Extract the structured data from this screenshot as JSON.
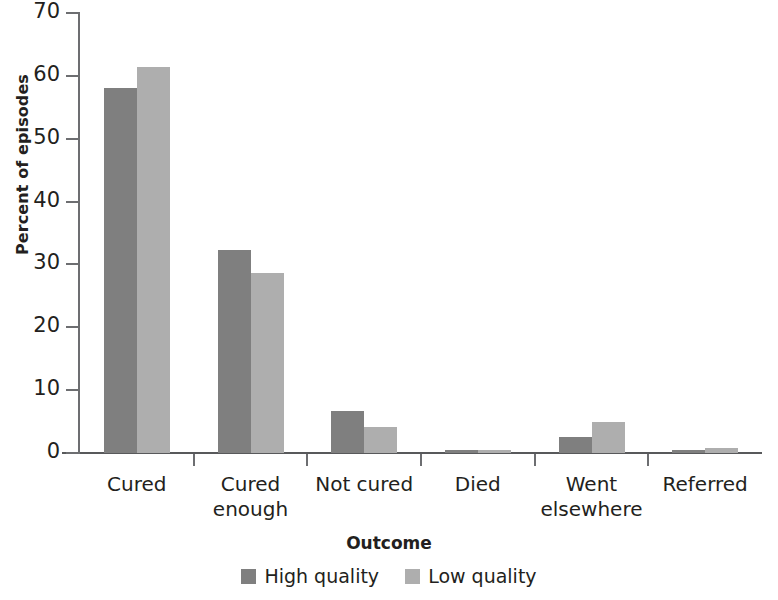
{
  "chart_data": {
    "type": "bar",
    "title": "",
    "xlabel": "Outcome",
    "ylabel": "Percent of episodes",
    "categories": [
      "Cured",
      "Cured enough",
      "Not cured",
      "Died",
      "Went elsewhere",
      "Referred"
    ],
    "category_lines": [
      [
        "Cured"
      ],
      [
        "Cured",
        "enough"
      ],
      [
        "Not cured"
      ],
      [
        "Died"
      ],
      [
        "Went",
        "elsewhere"
      ],
      [
        "Referred"
      ]
    ],
    "series": [
      {
        "name": "High quality",
        "color": "#7f7f7f",
        "values": [
          58.0,
          32.3,
          6.7,
          0.5,
          2.5,
          0.5
        ]
      },
      {
        "name": "Low quality",
        "color": "#aeaeae",
        "values": [
          61.4,
          28.6,
          4.1,
          0.4,
          4.9,
          0.8
        ]
      }
    ],
    "ylim": [
      0,
      70
    ],
    "yticks": [
      0,
      10,
      20,
      30,
      40,
      50,
      60,
      70
    ],
    "ytick_labels": [
      "0",
      "10",
      "20",
      "30",
      "40",
      "50",
      "60",
      "70"
    ],
    "grid": false,
    "legend_position": "bottom"
  },
  "legend": {
    "items": [
      {
        "label": "High quality",
        "color": "#7f7f7f"
      },
      {
        "label": "Low quality",
        "color": "#aeaeae"
      }
    ]
  },
  "axis": {
    "x_title": "Outcome",
    "y_title": "Percent of episodes"
  }
}
